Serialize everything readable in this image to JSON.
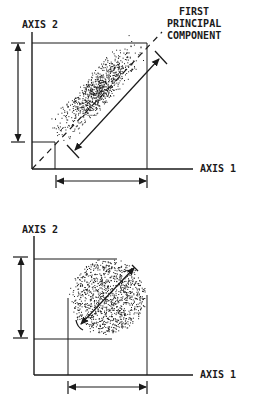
{
  "colors": {
    "ink": "#1a1a1a",
    "background": "#ffffff"
  },
  "top_diagram": {
    "y_axis_label": "AXIS 2",
    "x_axis_label": "AXIS 1",
    "annotation": [
      "FIRST",
      "PRINCIPAL",
      "COMPONENT"
    ],
    "cloud_shape": "elongated ellipse along diagonal"
  },
  "bottom_diagram": {
    "y_axis_label": "AXIS 2",
    "x_axis_label": "AXIS 1",
    "cloud_shape": "circular"
  }
}
